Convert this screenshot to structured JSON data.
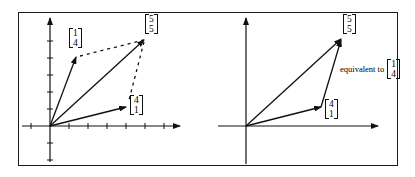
{
  "left_panel": {
    "vectors": [
      {
        "id": "v14",
        "top": "1",
        "bottom": "4"
      },
      {
        "id": "v55",
        "top": "5",
        "bottom": "5"
      },
      {
        "id": "v41",
        "top": "4",
        "bottom": "1"
      }
    ]
  },
  "right_panel": {
    "vectors": [
      {
        "id": "v55",
        "top": "5",
        "bottom": "5"
      },
      {
        "id": "v41",
        "top": "4",
        "bottom": "1"
      }
    ],
    "equivalent_text": "equivalent to",
    "equivalent_vector": {
      "top": "1",
      "bottom": "4"
    }
  },
  "colors": {
    "ink": "#111111",
    "background": "#ffffff"
  }
}
